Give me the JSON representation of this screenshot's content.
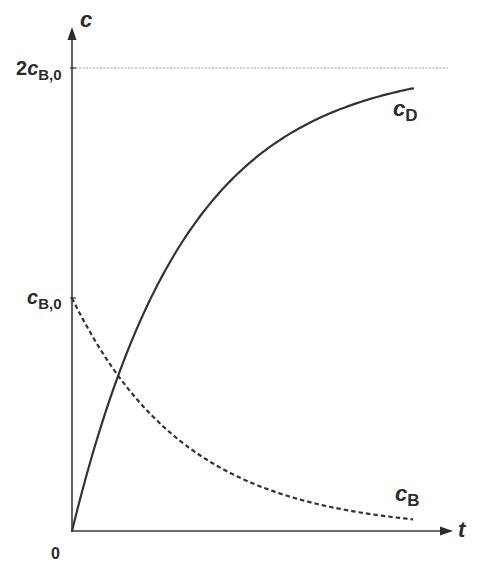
{
  "chart_data": {
    "type": "line",
    "title": "",
    "xlabel": "t",
    "ylabel": "c",
    "x_ticks": [
      "0"
    ],
    "y_ticks": [
      {
        "label": "c_B,0",
        "value": 1
      },
      {
        "label": "2c_B,0",
        "value": 2
      }
    ],
    "xlim": [
      0,
      1.1
    ],
    "ylim": [
      0,
      2.2
    ],
    "grid": false,
    "asymptote": {
      "y": 2,
      "label": "2c_B,0",
      "style": "dotted"
    },
    "model": "c_B = c_B,0 * exp(-3t); c_D = 2 c_B,0 * (1 - exp(-3t))",
    "x": [
      0,
      0.1,
      0.2,
      0.3,
      0.4,
      0.5,
      0.6,
      0.7,
      0.8,
      0.9,
      1.0
    ],
    "series": [
      {
        "name": "c_D",
        "style": "solid",
        "values": [
          0,
          0.52,
          0.9,
          1.19,
          1.4,
          1.55,
          1.67,
          1.76,
          1.82,
          1.87,
          1.9
        ]
      },
      {
        "name": "c_B",
        "style": "dashed",
        "values": [
          1.0,
          0.74,
          0.55,
          0.41,
          0.3,
          0.22,
          0.17,
          0.12,
          0.09,
          0.07,
          0.05
        ]
      }
    ],
    "annotations": [
      {
        "text": "c_D",
        "near": "end of solid curve"
      },
      {
        "text": "c_B",
        "near": "end of dashed curve"
      }
    ]
  },
  "labels": {
    "y_axis": "c",
    "x_axis": "t",
    "origin": "0",
    "tick_2cb0_prefix": "2",
    "tick_var": "c",
    "tick_sub": "B,0",
    "curve_d_var": "c",
    "curve_d_sub": "D",
    "curve_b_var": "c",
    "curve_b_sub": "B"
  },
  "colors": {
    "axis": "#3a3a3a",
    "curve": "#333333",
    "asymptote": "#9a9a9a",
    "background": "#ffffff"
  }
}
